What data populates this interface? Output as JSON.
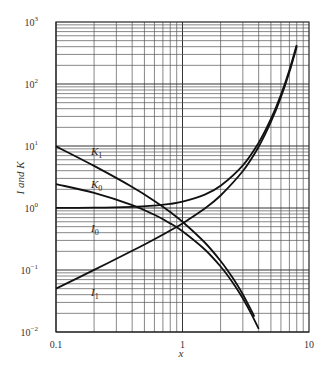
{
  "chart_data": {
    "type": "line",
    "title": "",
    "xlabel": "x",
    "ylabel": "I and K",
    "xscale": "log",
    "yscale": "log",
    "xlim": [
      0.1,
      10
    ],
    "ylim": [
      0.01,
      1000
    ],
    "grid": true,
    "legend": "inline labels",
    "x_tick_labels": [
      "0.1",
      "1",
      "10"
    ],
    "y_tick_labels": [
      {
        "base": "10",
        "exp": "-2"
      },
      {
        "base": "10",
        "exp": "-1"
      },
      {
        "base": "10",
        "exp": "0"
      },
      {
        "base": "10",
        "exp": "1"
      },
      {
        "base": "10",
        "exp": "2"
      },
      {
        "base": "10",
        "exp": "3"
      }
    ],
    "series": [
      {
        "name": "I0",
        "label_main": "I",
        "label_sub": "0",
        "x": [
          0.1,
          0.2,
          0.4,
          0.6,
          0.8,
          1.0,
          1.5,
          2.0,
          3.0,
          4.0,
          5.0,
          6.0,
          7.0,
          8.0
        ],
        "values": [
          1.0025,
          1.01,
          1.04,
          1.092,
          1.166,
          1.266,
          1.647,
          2.28,
          4.881,
          11.3,
          27.24,
          67.23,
          168.6,
          427.6
        ]
      },
      {
        "name": "I1",
        "label_main": "I",
        "label_sub": "1",
        "x": [
          0.1,
          0.2,
          0.4,
          0.6,
          0.8,
          1.0,
          1.5,
          2.0,
          3.0,
          4.0,
          5.0,
          6.0,
          7.0,
          8.0
        ],
        "values": [
          0.0501,
          0.1005,
          0.204,
          0.3137,
          0.4329,
          0.5652,
          0.9817,
          1.591,
          3.953,
          9.759,
          24.34,
          61.34,
          156.0,
          399.9
        ]
      },
      {
        "name": "K0",
        "label_main": "K",
        "label_sub": "0",
        "x": [
          0.1,
          0.2,
          0.4,
          0.6,
          0.8,
          1.0,
          1.5,
          2.0,
          2.5,
          3.0,
          3.5,
          4.0
        ],
        "values": [
          2.427,
          1.753,
          1.115,
          0.7775,
          0.5653,
          0.421,
          0.2138,
          0.1139,
          0.0623,
          0.0347,
          0.0196,
          0.0112
        ]
      },
      {
        "name": "K1",
        "label_main": "K",
        "label_sub": "1",
        "x": [
          0.1,
          0.2,
          0.4,
          0.6,
          0.8,
          1.0,
          1.5,
          2.0,
          2.5,
          3.0,
          3.5,
          3.7
        ],
        "values": [
          9.854,
          4.776,
          2.184,
          1.303,
          0.8618,
          0.6019,
          0.2774,
          0.1399,
          0.0739,
          0.0402,
          0.0222,
          0.0177
        ]
      }
    ]
  },
  "caption": "Figure"
}
